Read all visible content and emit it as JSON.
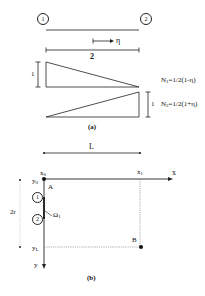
{
  "figure_a": {
    "node_labels": [
      "1",
      "2"
    ],
    "coordinate_arrow_label": "η",
    "element_length_label": "2",
    "shape_function_height_labels": [
      "1",
      "1"
    ],
    "shape_functions": {
      "N1": {
        "name": "N",
        "index": "1",
        "formula": "=1/2(1-η)"
      },
      "N2": {
        "name": "N",
        "index": "2",
        "formula": "=1/2(1+η)"
      }
    },
    "caption": "(a)"
  },
  "figure_b": {
    "length_label": "L",
    "x_axis_label": "x",
    "y_axis_label": "y",
    "x0_label": {
      "name": "x",
      "index": "0"
    },
    "x1_label": {
      "name": "x",
      "index": "1"
    },
    "y0_label": {
      "name": "y",
      "index": "0"
    },
    "yL_label": {
      "name": "y",
      "index": "L"
    },
    "height_label": "2r",
    "point_a_label": "A",
    "point_b_label": "B",
    "node_labels": [
      "1",
      "2"
    ],
    "boundary_label": {
      "name": "Ω",
      "index": "1"
    },
    "caption": "(b)"
  },
  "colors": {
    "line": "#222222",
    "dotted": "#777777",
    "background": "#ffffff"
  }
}
